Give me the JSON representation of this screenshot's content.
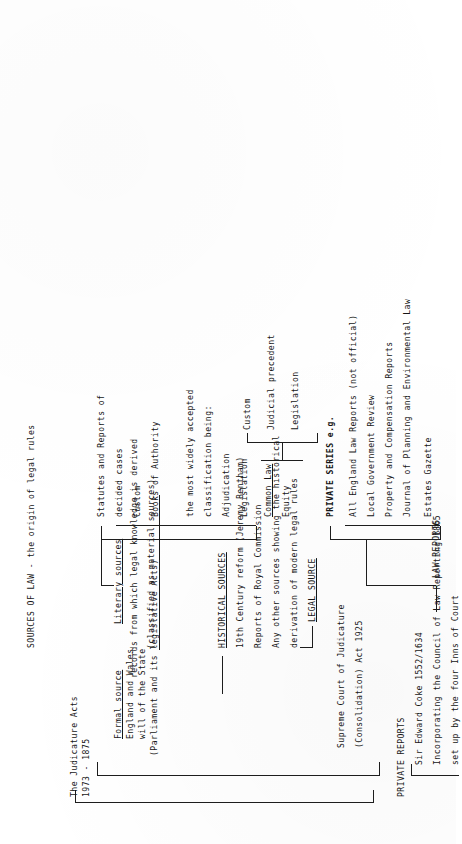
{
  "document": {
    "title": "SOURCES OF LAW - the origin of legal rules",
    "type": "typewritten-tree-diagram",
    "orientation": "rotated-90-ccw"
  },
  "blocks": {
    "judicature": {
      "line1": "The Judicature Acts",
      "line2": "1973 - 1875"
    },
    "formal": {
      "heading": "Formal source",
      "line1": "England and Wales",
      "line2": "will of the State",
      "line3": "(Parliament and its legislative Acts)"
    },
    "literary": {
      "heading": "Literary sources",
      "line1": "records from which legal knowledge is derived",
      "line2": "(classified as material sources)"
    },
    "material": {
      "line1": "Statutes and Reports of",
      "line2": "decided cases",
      "line3": "Custom",
      "line4": "Books of Authority"
    },
    "classification": {
      "line1": "the most widely accepted",
      "line2": "classification being:",
      "line3": "Adjudication",
      "line4": "Legislation"
    },
    "commonlaw": {
      "item1": "Common Law",
      "item2": "Equity"
    },
    "outcomes": {
      "item1": "Custom",
      "item2": "Judicial precedent",
      "item3": "Legislation"
    },
    "historical": {
      "heading": "HISTORICAL SOURCES",
      "line1": "19th Century reform (Jeremy Bentham)",
      "line2": "Reports of Royal Commission",
      "line3": "Any other sources showing the historical",
      "line4": "derivation of modern legal rules"
    },
    "legalsource": {
      "heading": "LEGAL SOURCE"
    },
    "supremecourt": {
      "line1": "Supreme Court of Judicature",
      "line2": "(Consolidation) Act 1925"
    },
    "privatereports": {
      "heading": "PRIVATE REPORTS",
      "line1": "Sir Edward Coke 1552/1634",
      "line2": "Incorporating the Council of Law Reporting 1865",
      "line3": "set up by the four Inns of Court"
    },
    "lawreports": {
      "heading": "LAW REPORTS"
    },
    "privateseries": {
      "heading": "PRIVATE SERIES e.g.",
      "item1": "All England Law Reports (not official)",
      "item2": "Local Government Review",
      "item3": "Property and Compensation Reports",
      "item4": "Journal of Planning and Environmental Law",
      "item5": "Estates Gazette"
    }
  },
  "colors": {
    "ink": "#1a1a1a",
    "paper": "#ffffff"
  }
}
